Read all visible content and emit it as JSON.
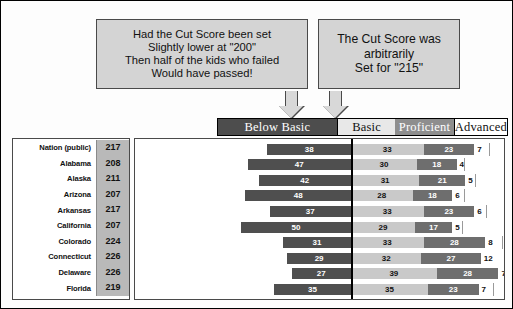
{
  "callouts": {
    "left": {
      "name": "cut-score-200-callout",
      "lines": [
        "Had the Cut Score been set",
        "Slightly lower at \"200\"",
        "Then half of the kids who failed",
        "Would have passed!"
      ]
    },
    "right": {
      "name": "cut-score-215-callout",
      "lines": [
        "The Cut Score was",
        "arbitrarily",
        "Set for \"215\""
      ]
    }
  },
  "chart_data": {
    "type": "bar",
    "subtype": "stacked-horizontal-100percent",
    "title": "",
    "xlabel": "",
    "ylabel": "",
    "legend_position": "top",
    "grid": false,
    "cut_line_at_category_boundary": "Below Basic | Basic",
    "categories": [
      "Below Basic",
      "Basic",
      "Proficient",
      "Advanced"
    ],
    "value_columns": [
      "Score"
    ],
    "rows": [
      {
        "state": "Nation (public)",
        "score": "217",
        "values": [
          38,
          33,
          23,
          7
        ]
      },
      {
        "state": "Alabama",
        "score": "208",
        "values": [
          47,
          30,
          18,
          4
        ]
      },
      {
        "state": "Alaska",
        "score": "211",
        "values": [
          42,
          31,
          21,
          5
        ]
      },
      {
        "state": "Arizona",
        "score": "207",
        "values": [
          48,
          28,
          18,
          6
        ]
      },
      {
        "state": "Arkansas",
        "score": "217",
        "values": [
          37,
          33,
          23,
          6
        ]
      },
      {
        "state": "California",
        "score": "207",
        "values": [
          50,
          29,
          17,
          5
        ]
      },
      {
        "state": "Colorado",
        "score": "224",
        "values": [
          31,
          33,
          28,
          8
        ]
      },
      {
        "state": "Connecticut",
        "score": "226",
        "values": [
          29,
          32,
          27,
          12
        ]
      },
      {
        "state": "Delaware",
        "score": "226",
        "values": [
          27,
          39,
          28,
          7
        ]
      },
      {
        "state": "Florida",
        "score": "219",
        "values": [
          35,
          35,
          23,
          7
        ]
      }
    ]
  },
  "colors": {
    "below_basic": "#4f4f4f",
    "basic": "#c9c9c9",
    "proficient": "#6e6e6e",
    "advanced": "#ffffff",
    "callout_fill": "#d4d4d4",
    "score_column_fill": "#b9b9b9",
    "cut_line": "#000000"
  },
  "icons": {
    "arrow_1": "arrow-down-icon",
    "arrow_2": "arrow-down-icon"
  }
}
